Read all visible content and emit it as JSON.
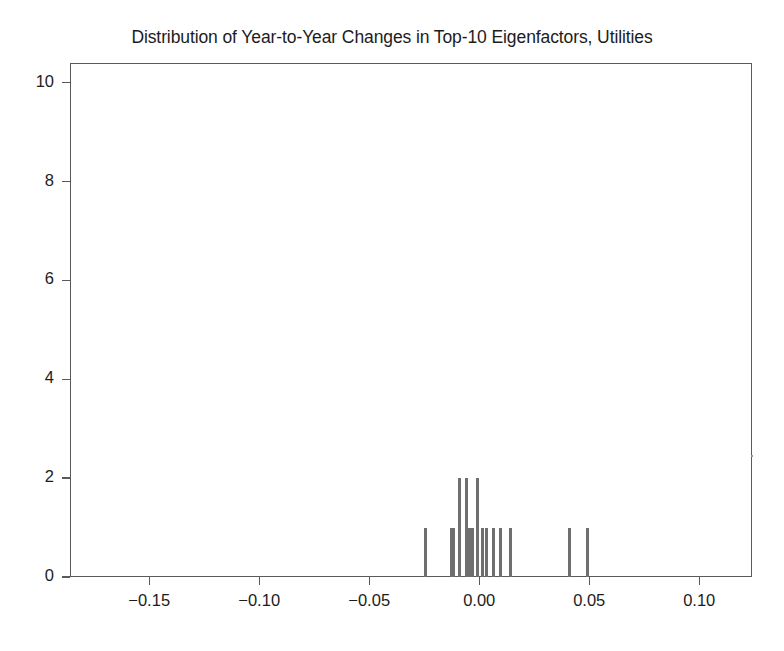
{
  "chart_data": {
    "type": "bar",
    "title": "Distribution of Year-to-Year Changes in Top-10 Eigenfactors, Utilities",
    "xlabel": "",
    "ylabel": "",
    "xlim": [
      -0.186,
      0.124
    ],
    "ylim": [
      0,
      10.4
    ],
    "grid": false,
    "legend": null,
    "xticks": [
      "-0.15",
      "-0.10",
      "-0.05",
      "0.00",
      "0.05",
      "0.10"
    ],
    "xtick_values": [
      -0.15,
      -0.1,
      -0.05,
      0.0,
      0.05,
      0.1
    ],
    "yticks": [
      "0",
      "2",
      "4",
      "6",
      "8",
      "10"
    ],
    "ytick_values": [
      0,
      2,
      4,
      6,
      8,
      10
    ],
    "bar_color": "#6f6f6f",
    "bins": [
      {
        "x": -0.0245,
        "count": 1
      },
      {
        "x": -0.0127,
        "count": 1
      },
      {
        "x": -0.0118,
        "count": 1
      },
      {
        "x": -0.0091,
        "count": 2
      },
      {
        "x": -0.0059,
        "count": 2
      },
      {
        "x": -0.0045,
        "count": 1
      },
      {
        "x": -0.0032,
        "count": 1
      },
      {
        "x": -0.0009,
        "count": 2
      },
      {
        "x": 0.0014,
        "count": 1
      },
      {
        "x": 0.0032,
        "count": 1
      },
      {
        "x": 0.0064,
        "count": 1
      },
      {
        "x": 0.0095,
        "count": 1
      },
      {
        "x": 0.0141,
        "count": 1
      },
      {
        "x": 0.0409,
        "count": 1
      },
      {
        "x": 0.0491,
        "count": 1
      }
    ]
  },
  "axes": {
    "x_tick_labels": [
      "-0.15",
      "-0.10",
      "-0.05",
      "0.00",
      "0.05",
      "0.10"
    ],
    "y_tick_labels": [
      "0",
      "2",
      "4",
      "6",
      "8",
      "10"
    ]
  }
}
